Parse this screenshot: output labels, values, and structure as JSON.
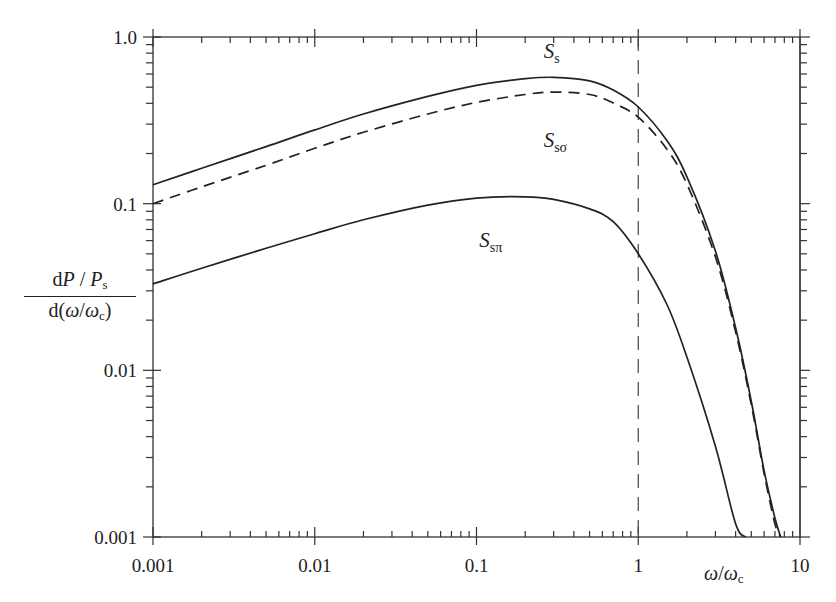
{
  "chart_data": {
    "type": "line",
    "title": "",
    "xlabel": "ω/ωc",
    "ylabel": "dP/Ps / d(ω/ωc)",
    "xscale": "log",
    "yscale": "log",
    "xlim": [
      0.001,
      10
    ],
    "ylim": [
      0.001,
      1.0
    ],
    "x_ticks": [
      "0.001",
      "0.01",
      "0.1",
      "1",
      "10"
    ],
    "y_ticks": [
      "0.001",
      "0.01",
      "0.1",
      "1.0"
    ],
    "grid": false,
    "legend": "inline curve labels",
    "vertical_reference_line": {
      "x": 1,
      "style": "dashed"
    },
    "x": [
      0.001,
      0.002,
      0.005,
      0.01,
      0.02,
      0.05,
      0.1,
      0.2,
      0.3,
      0.5,
      0.7,
      1.0,
      1.5,
      2.0,
      3.0,
      4.0,
      5.0,
      6.0,
      7.0,
      7.6
    ],
    "series": [
      {
        "name": "Ss",
        "style": "solid",
        "label_pos": {
          "x": 0.3,
          "y": 0.75
        },
        "values": [
          0.13,
          0.163,
          0.22,
          0.277,
          0.345,
          0.44,
          0.513,
          0.562,
          0.573,
          0.545,
          0.48,
          0.38,
          0.24,
          0.145,
          0.052,
          0.018,
          0.0065,
          0.0025,
          0.0013,
          0.001
        ]
      },
      {
        "name": "Ssσ",
        "style": "dashed",
        "label_pos": {
          "x": 0.3,
          "y": 0.22
        },
        "values": [
          0.1,
          0.126,
          0.17,
          0.215,
          0.268,
          0.345,
          0.405,
          0.452,
          0.467,
          0.452,
          0.402,
          0.33,
          0.213,
          0.131,
          0.048,
          0.017,
          0.0062,
          0.0024,
          0.0012,
          0.001
        ]
      },
      {
        "name": "Ssπ",
        "style": "solid",
        "label_pos": {
          "x": 0.12,
          "y": 0.055
        },
        "values": [
          0.033,
          0.041,
          0.054,
          0.066,
          0.08,
          0.098,
          0.108,
          0.11,
          0.106,
          0.093,
          0.078,
          0.05,
          0.025,
          0.012,
          0.0035,
          0.0012,
          null,
          null,
          null,
          null
        ]
      }
    ],
    "pi_end": {
      "x": 4.6,
      "y": 0.001
    }
  },
  "labels": {
    "ylabel_num": [
      "d",
      "P",
      " / ",
      "P",
      "s"
    ],
    "ylabel_den": [
      "d(",
      "ω",
      "/",
      "ω",
      "c",
      ")"
    ],
    "xlabel": [
      "ω",
      "/",
      "ω",
      "c"
    ],
    "series_labels": [
      {
        "main": "S",
        "sub": "s"
      },
      {
        "main": "S",
        "sub": "sσ"
      },
      {
        "main": "S",
        "sub": "sπ"
      }
    ]
  }
}
